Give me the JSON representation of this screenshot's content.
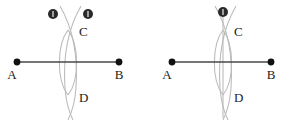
{
  "figure": {
    "background_color": "#ffffff",
    "width": 292,
    "height": 124,
    "colors": {
      "segment": "#4a4a4a",
      "endpoint": "#111111",
      "arc": "#b9b9b9",
      "label": "#1a1a1a",
      "marker": "#2a2a2a"
    },
    "panels": [
      {
        "id": "left",
        "caption": "",
        "segment": {
          "label_a": "A",
          "label_b": "B",
          "a_x": 17,
          "a_y": 62,
          "b_x": 119,
          "b_y": 62
        },
        "intersections": [
          {
            "label": "C",
            "x": 68,
            "y": 30
          },
          {
            "label": "D",
            "x": 68,
            "y": 95
          }
        ],
        "compass_markers": [
          {
            "label": "1",
            "x": 53,
            "y": 14
          },
          {
            "label": "1",
            "x": 88,
            "y": 14
          }
        ],
        "has_bisector_line": false
      },
      {
        "id": "right",
        "caption": "",
        "segment": {
          "label_a": "A",
          "label_b": "B",
          "a_x": 172,
          "a_y": 62,
          "b_x": 271,
          "b_y": 62
        },
        "intersections": [
          {
            "label": "C",
            "x": 223,
            "y": 30
          },
          {
            "label": "D",
            "x": 223,
            "y": 95
          }
        ],
        "compass_markers": [
          {
            "label": "2",
            "x": 223,
            "y": 12
          }
        ],
        "has_bisector_line": true
      }
    ]
  }
}
